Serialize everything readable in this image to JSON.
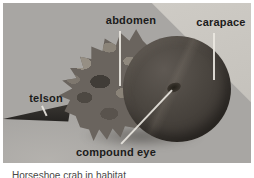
{
  "figure": {
    "labels": {
      "abdomen": "abdomen",
      "carapace": "carapace",
      "telson": "telson",
      "compound_eye": "compound eye"
    },
    "caption": "Horseshoe crab in habitat",
    "colors": {
      "page_background": "#ffffff",
      "photo_background": "#a8a6a3",
      "light_sand": "#c9c6c0",
      "crab_dome_dark": "#45413d",
      "crab_body_mid": "#6a645e",
      "crab_body_light": "#8f897f",
      "telson_dark": "#2e2b28",
      "label_text": "#1b1b1b",
      "leader_line": "#ebe8e1",
      "caption_text": "#4a4846"
    }
  }
}
